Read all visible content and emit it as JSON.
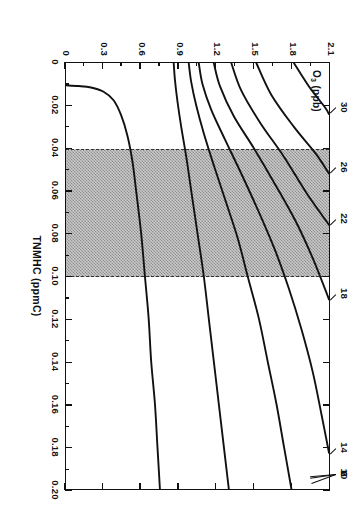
{
  "chart_data": {
    "type": "line",
    "title": "",
    "key_label": "O3 (ppb)",
    "xlabel": "TNMHC (ppmC)",
    "ylabel": "NOx (ppb)",
    "xlim": [
      0,
      0.2
    ],
    "ylim": [
      0,
      2.1
    ],
    "grid": false,
    "legend_position": "inline-contour-labels",
    "xticks": [
      "0",
      "0.02",
      "0.04",
      "0.06",
      "0.08",
      "0.10",
      "0.12",
      "0.14",
      "0.16",
      "0.18",
      "0.20"
    ],
    "xtick_values": [
      0,
      0.02,
      0.04,
      0.06,
      0.08,
      0.1,
      0.12,
      0.14,
      0.16,
      0.18,
      0.2
    ],
    "yticks": [
      "0",
      "0.3",
      "0.6",
      "0.9",
      "1.2",
      "1.5",
      "1.8",
      "2.1"
    ],
    "ytick_values": [
      0,
      0.3,
      0.6,
      0.9,
      1.2,
      1.5,
      1.8,
      2.1
    ],
    "shaded_band": {
      "label": "",
      "x_start": 0.04,
      "x_end": 0.1
    },
    "contour_unit": "ppb",
    "contour_levels": [
      2,
      6,
      10,
      14,
      18,
      22,
      26,
      30
    ],
    "series": [
      {
        "name": "2",
        "label": "2",
        "points": [
          [
            0.0105,
            0.0
          ],
          [
            0.0108,
            0.1
          ],
          [
            0.0115,
            0.2
          ],
          [
            0.0135,
            0.3
          ],
          [
            0.0175,
            0.38
          ],
          [
            0.0245,
            0.44
          ],
          [
            0.034,
            0.49
          ],
          [
            0.046,
            0.53
          ],
          [
            0.06,
            0.56
          ],
          [
            0.08,
            0.6
          ],
          [
            0.1,
            0.63
          ],
          [
            0.12,
            0.66
          ],
          [
            0.14,
            0.68
          ],
          [
            0.16,
            0.71
          ],
          [
            0.18,
            0.73
          ],
          [
            0.2,
            0.75
          ]
        ]
      },
      {
        "name": "6",
        "label": "6",
        "points": [
          [
            0.0,
            0.86
          ],
          [
            0.008,
            0.87
          ],
          [
            0.018,
            0.89
          ],
          [
            0.03,
            0.92
          ],
          [
            0.044,
            0.96
          ],
          [
            0.06,
            1.0
          ],
          [
            0.08,
            1.05
          ],
          [
            0.1,
            1.1
          ],
          [
            0.12,
            1.14
          ],
          [
            0.14,
            1.18
          ],
          [
            0.16,
            1.22
          ],
          [
            0.18,
            1.26
          ],
          [
            0.2,
            1.3
          ]
        ]
      },
      {
        "name": "10",
        "label": "10",
        "points": [
          [
            0.0,
            0.98
          ],
          [
            0.009,
            1.0
          ],
          [
            0.02,
            1.04
          ],
          [
            0.033,
            1.1
          ],
          [
            0.048,
            1.18
          ],
          [
            0.064,
            1.27
          ],
          [
            0.082,
            1.37
          ],
          [
            0.1,
            1.45
          ],
          [
            0.12,
            1.54
          ],
          [
            0.14,
            1.61
          ],
          [
            0.16,
            1.68
          ],
          [
            0.18,
            1.74
          ],
          [
            0.2,
            1.8
          ]
        ]
      },
      {
        "name": "14",
        "label": "14",
        "points": [
          [
            0.0,
            1.06
          ],
          [
            0.01,
            1.09
          ],
          [
            0.022,
            1.16
          ],
          [
            0.036,
            1.27
          ],
          [
            0.052,
            1.4
          ],
          [
            0.07,
            1.54
          ],
          [
            0.088,
            1.67
          ],
          [
            0.106,
            1.78
          ],
          [
            0.125,
            1.88
          ],
          [
            0.145,
            1.97
          ],
          [
            0.165,
            2.04
          ],
          [
            0.183,
            2.1
          ]
        ]
      },
      {
        "name": "18",
        "label": "18",
        "points": [
          [
            0.0,
            1.18
          ],
          [
            0.011,
            1.23
          ],
          [
            0.025,
            1.34
          ],
          [
            0.04,
            1.5
          ],
          [
            0.057,
            1.67
          ],
          [
            0.075,
            1.84
          ],
          [
            0.093,
            1.98
          ],
          [
            0.111,
            2.1
          ]
        ]
      },
      {
        "name": "22",
        "label": "22",
        "points": [
          [
            0.0,
            1.32
          ],
          [
            0.013,
            1.4
          ],
          [
            0.028,
            1.55
          ],
          [
            0.044,
            1.74
          ],
          [
            0.061,
            1.92
          ],
          [
            0.076,
            2.1
          ]
        ]
      },
      {
        "name": "26",
        "label": "26",
        "points": [
          [
            0.0,
            1.52
          ],
          [
            0.015,
            1.64
          ],
          [
            0.03,
            1.82
          ],
          [
            0.043,
            2.0
          ],
          [
            0.052,
            2.1
          ]
        ]
      },
      {
        "name": "30",
        "label": "30",
        "points": [
          [
            0.0,
            1.82
          ],
          [
            0.011,
            1.94
          ],
          [
            0.021,
            2.07
          ],
          [
            0.024,
            2.1
          ]
        ]
      }
    ]
  }
}
